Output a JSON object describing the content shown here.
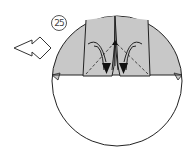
{
  "diagram": {
    "type": "origami-step",
    "step_number": "25",
    "arrow_icon": "hollow-right-arrow",
    "colors": {
      "paper_gray": "#c8c8c8",
      "outline": "#222222",
      "background": "#ffffff"
    }
  }
}
